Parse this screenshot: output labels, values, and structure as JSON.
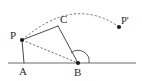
{
  "figure": {
    "type": "geometry-diagram",
    "background_color": "#ffffff",
    "line_color": "#4a4a4a",
    "dash_color": "#6e6e6e",
    "label_color": "#2b2b2b",
    "dot_color": "#1c1c1c"
  },
  "points": [
    {
      "id": "A",
      "label": "A",
      "x": 24,
      "y": 63,
      "label_x": 19,
      "label_y": 75,
      "has_dot": false
    },
    {
      "id": "B",
      "label": "B",
      "x": 78,
      "y": 63,
      "label_x": 74,
      "label_y": 76,
      "has_dot": true
    },
    {
      "id": "C",
      "label": "C",
      "x": 58,
      "y": 26,
      "label_x": 60,
      "label_y": 23,
      "has_dot": false
    },
    {
      "id": "P",
      "label": "P",
      "x": 22,
      "y": 40,
      "label_x": 10,
      "label_y": 39,
      "has_dot": true
    },
    {
      "id": "P'",
      "label": "P'",
      "x": 119,
      "y": 27,
      "label_x": 121,
      "label_y": 24,
      "has_dot": true
    }
  ],
  "segments": [
    {
      "id": "AP",
      "from": "A",
      "to": "P",
      "style": "solid",
      "path": "M 24 63 L 22 40"
    },
    {
      "id": "PC",
      "from": "P",
      "to": "C",
      "style": "solid",
      "path": "M 22 40 L 58 26"
    },
    {
      "id": "CB",
      "from": "C",
      "to": "B",
      "style": "solid",
      "path": "M 58 26 L 78 63"
    },
    {
      "id": "PB",
      "from": "P",
      "to": "B",
      "style": "dashed",
      "path": "M 22 40 L 78 63"
    }
  ],
  "baseline": {
    "id": "line-AB-extended",
    "x1": 8,
    "y1": 63,
    "x2": 136,
    "y2": 63,
    "style": "solid"
  },
  "rotation_arc": {
    "id": "arc-P-to-Pprime",
    "style": "dashed",
    "center": "B",
    "from": "P",
    "to": "P'",
    "path": "M 22 40 Q 74 -5 119 27"
  },
  "angle_mark": {
    "id": "angle-at-B",
    "vertex": "B",
    "radius": 11,
    "path": "M 71 53 A 11 11 0 0 1 89 63"
  }
}
